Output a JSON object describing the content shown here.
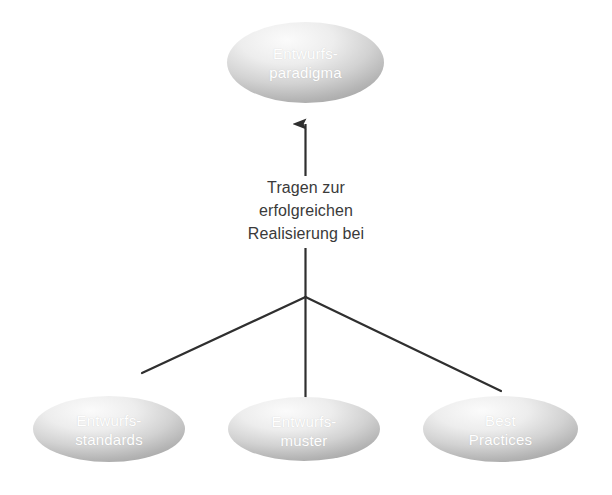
{
  "diagram": {
    "background_color": "#ffffff",
    "node_fill_light": "#f2f2f2",
    "node_fill_dark": "#a8a8a8",
    "node_text_color": "#ffffff",
    "connector_color": "#3a3a3a",
    "edge_label_color": "#3a3a3a"
  },
  "nodes": {
    "top": {
      "id": "entwurfsparadigma",
      "line1": "Entwurfs-",
      "line2": "paradigma"
    },
    "bottom_left": {
      "id": "entwurfsstandards",
      "line1": "Entwurfs-",
      "line2": "standards"
    },
    "bottom_center": {
      "id": "entwurfsmuster",
      "line1": "Entwurfs-",
      "line2": "muster"
    },
    "bottom_right": {
      "id": "best-practices",
      "line1": "Best",
      "line2": "Practices"
    }
  },
  "edge_label": {
    "line1": "Tragen zur",
    "line2": "erfolgreichen",
    "line3": "Realisierung bei"
  }
}
